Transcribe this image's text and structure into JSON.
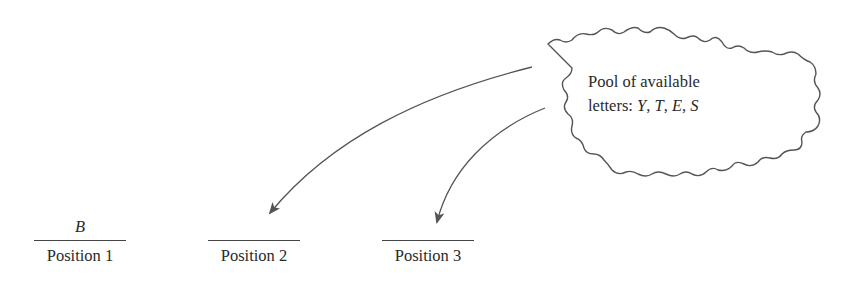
{
  "cloud": {
    "line1": "Pool of available",
    "line2_prefix": "letters: ",
    "letters": [
      "Y",
      "T",
      "E",
      "S"
    ],
    "separator": ", "
  },
  "positions": [
    {
      "label": "Position 1",
      "letter": "B"
    },
    {
      "label": "Position 2",
      "letter": ""
    },
    {
      "label": "Position 3",
      "letter": ""
    }
  ],
  "arrows": [
    {
      "from": "cloud",
      "to": "Position 2"
    },
    {
      "from": "cloud",
      "to": "Position 3"
    }
  ],
  "colors": {
    "stroke": "#555555",
    "text": "#2a2a2a"
  }
}
